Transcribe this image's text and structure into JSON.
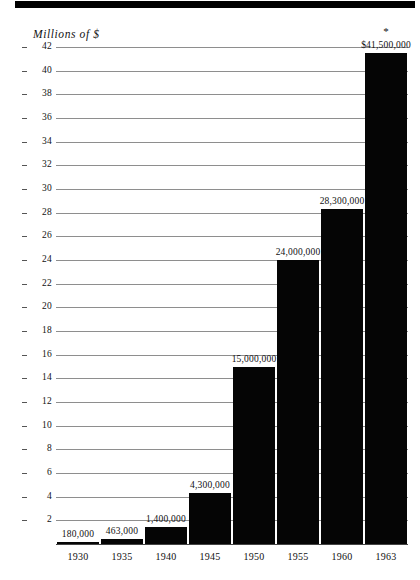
{
  "chart_data": {
    "type": "bar",
    "title": "",
    "subtitle": "",
    "ylabel": "Millions of $",
    "xlabel": "",
    "categories": [
      "1930",
      "1935",
      "1940",
      "1945",
      "1950",
      "1955",
      "1960",
      "1963"
    ],
    "values": [
      0.18,
      0.463,
      1.4,
      4.3,
      15.0,
      24.0,
      28.3,
      41.5
    ],
    "value_labels": [
      "180,000",
      "463,000",
      "1,400,000",
      "4,300,000",
      "15,000,000",
      "24,000,000",
      "28,300,000",
      "$41,500,000"
    ],
    "annotations": [
      {
        "category": "1963",
        "marker": "*"
      }
    ],
    "ylim": [
      0,
      43
    ],
    "y_ticks": [
      2,
      4,
      6,
      8,
      10,
      12,
      14,
      16,
      18,
      20,
      22,
      24,
      26,
      28,
      30,
      32,
      34,
      36,
      38,
      40,
      42
    ],
    "y_tick_labels": [
      "2",
      "4",
      "6",
      "8",
      "10",
      "12",
      "14",
      "16",
      "18",
      "20",
      "22",
      "24",
      "26",
      "28",
      "30",
      "32",
      "34",
      "36",
      "38",
      "40",
      "42"
    ],
    "grid": true,
    "legend": null,
    "bar_color": "#050505",
    "grid_color": "#8e8e8e",
    "background_color": "#ffffff"
  },
  "decor": {
    "top_rule_color": "#000000"
  }
}
